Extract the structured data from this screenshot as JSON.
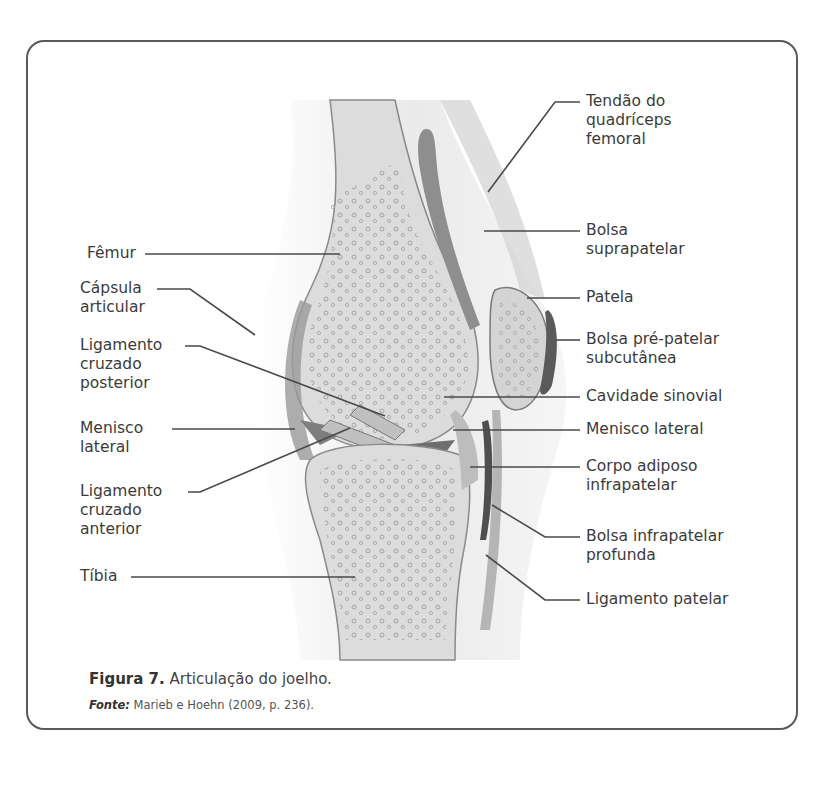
{
  "figure": {
    "caption_label": "Figura 7.",
    "caption_text": " Articulação do joelho.",
    "source_label": "Fonte:",
    "source_text": " Marieb e Hoehn (2009, p. 236)."
  },
  "labels_left": [
    {
      "id": "femur",
      "text": "Fêmur"
    },
    {
      "id": "capsula",
      "text": "Cápsula\narticular"
    },
    {
      "id": "lcp",
      "text": "Ligamento\ncruzado\nposterior"
    },
    {
      "id": "menisco-lateral-left",
      "text": "Menisco\nlateral"
    },
    {
      "id": "lca",
      "text": "Ligamento\ncruzado\nanterior"
    },
    {
      "id": "tibia",
      "text": "Tíbia"
    }
  ],
  "labels_right": [
    {
      "id": "tendao",
      "text": "Tendão do\nquadríceps\nfemoral"
    },
    {
      "id": "bolsa-supra",
      "text": "Bolsa\nsuprapatelar"
    },
    {
      "id": "patela",
      "text": "Patela"
    },
    {
      "id": "bolsa-pre",
      "text": "Bolsa pré-patelar\nsubcutânea"
    },
    {
      "id": "cavidade",
      "text": "Cavidade sinovial"
    },
    {
      "id": "menisco-lateral-right",
      "text": "Menisco lateral"
    },
    {
      "id": "corpo-adiposo",
      "text": "Corpo adiposo\ninfrapatelar"
    },
    {
      "id": "bolsa-infra",
      "text": "Bolsa infrapatelar\nprofunda"
    },
    {
      "id": "lig-patelar",
      "text": "Ligamento patelar"
    }
  ],
  "colors": {
    "frame": "#5a5a5a",
    "bone": "#d9d9d9",
    "line": "#4a4a4a"
  }
}
